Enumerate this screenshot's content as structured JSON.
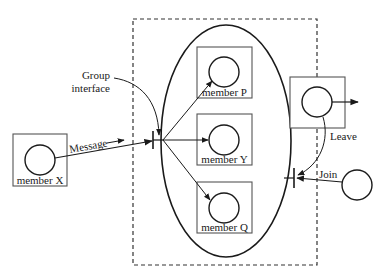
{
  "diagram": {
    "group_boundary": {
      "style": "dashed"
    },
    "group": {
      "shape": "ellipse",
      "members": [
        {
          "id": "P",
          "label": "member P"
        },
        {
          "id": "Y",
          "label": "member Y"
        },
        {
          "id": "Q",
          "label": "member Q"
        }
      ]
    },
    "outside_member": {
      "label": "member X"
    },
    "group_interface_label_line1": "Group",
    "group_interface_label_line2": "interface",
    "message_label": "Message",
    "leave_label": "Leave",
    "join_label": "Join",
    "colors": {
      "stroke": "#1a1a1a",
      "box": "#555555",
      "background": "#ffffff"
    }
  }
}
